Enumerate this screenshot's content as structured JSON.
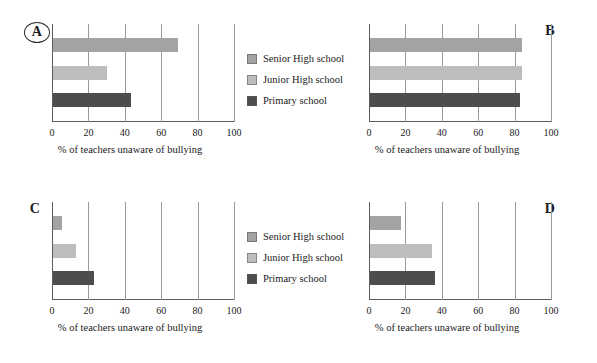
{
  "figure": {
    "x_axis_title": "% of teachers unaware of bullying",
    "tick_labels": [
      "0",
      "20",
      "40",
      "60",
      "80",
      "100"
    ],
    "x_min": 0,
    "x_max": 100,
    "colors": {
      "senior": "#a3a3a3",
      "junior": "#bdbdbd",
      "primary": "#4d4d4d",
      "axis": "#5d5d5d",
      "gridline": "#9a9a9a",
      "text": "#1a1a1a",
      "background": "#ffffff"
    }
  },
  "legend_top": {
    "name": "legend-top",
    "items": [
      {
        "label": "Senior High school",
        "color": "#a3a3a3",
        "swatch": "senior-swatch"
      },
      {
        "label": "Junior High school",
        "color": "#bdbdbd",
        "swatch": "junior-swatch"
      },
      {
        "label": "Primary school",
        "color": "#4d4d4d",
        "swatch": "primary-swatch"
      }
    ]
  },
  "legend_bottom": {
    "name": "legend-bottom",
    "items": [
      {
        "label": "Senior High school",
        "color": "#a3a3a3",
        "swatch": "senior-swatch"
      },
      {
        "label": "Junior High school",
        "color": "#bdbdbd",
        "swatch": "junior-swatch"
      },
      {
        "label": "Primary school",
        "color": "#4d4d4d",
        "swatch": "primary-swatch"
      }
    ]
  },
  "panels": [
    {
      "id": "A",
      "letter": "A",
      "circled": true,
      "position": "top-left"
    },
    {
      "id": "B",
      "letter": "B",
      "circled": false,
      "position": "top-right"
    },
    {
      "id": "C",
      "letter": "C",
      "circled": false,
      "position": "bottom-left"
    },
    {
      "id": "D",
      "letter": "D",
      "circled": false,
      "position": "bottom-right"
    }
  ],
  "chart_data": [
    {
      "type": "bar",
      "orientation": "horizontal",
      "panel": "A",
      "title": "A",
      "xlabel": "% of teachers unaware of bullying",
      "ylabel": "",
      "xlim": [
        0,
        100
      ],
      "xticks": [
        0,
        20,
        40,
        60,
        80,
        100
      ],
      "grid": true,
      "legend_position": "right",
      "categories": [
        "Senior High school",
        "Junior High school",
        "Primary school"
      ],
      "values": [
        69,
        30,
        43
      ],
      "colors": [
        "#a3a3a3",
        "#bdbdbd",
        "#4d4d4d"
      ]
    },
    {
      "type": "bar",
      "orientation": "horizontal",
      "panel": "B",
      "title": "B",
      "xlabel": "% of teachers unaware of bullying",
      "ylabel": "",
      "xlim": [
        0,
        100
      ],
      "xticks": [
        0,
        20,
        40,
        60,
        80,
        100
      ],
      "grid": true,
      "legend_position": "left",
      "categories": [
        "Senior High school",
        "Junior High school",
        "Primary school"
      ],
      "values": [
        84,
        84,
        83
      ],
      "colors": [
        "#a3a3a3",
        "#bdbdbd",
        "#4d4d4d"
      ]
    },
    {
      "type": "bar",
      "orientation": "horizontal",
      "panel": "C",
      "title": "C",
      "xlabel": "% of teachers unaware of bullying",
      "ylabel": "",
      "xlim": [
        0,
        100
      ],
      "xticks": [
        0,
        20,
        40,
        60,
        80,
        100
      ],
      "grid": true,
      "legend_position": "right",
      "categories": [
        "Senior High school",
        "Junior High school",
        "Primary school"
      ],
      "values": [
        5,
        12.5,
        22.5
      ],
      "colors": [
        "#a3a3a3",
        "#bdbdbd",
        "#4d4d4d"
      ]
    },
    {
      "type": "bar",
      "orientation": "horizontal",
      "panel": "D",
      "title": "D",
      "xlabel": "% of teachers unaware of bullying",
      "ylabel": "",
      "xlim": [
        0,
        100
      ],
      "xticks": [
        0,
        20,
        40,
        60,
        80,
        100
      ],
      "grid": true,
      "legend_position": "left",
      "categories": [
        "Senior High school",
        "Junior High school",
        "Primary school"
      ],
      "values": [
        17,
        34,
        36
      ],
      "colors": [
        "#a3a3a3",
        "#bdbdbd",
        "#4d4d4d"
      ]
    }
  ]
}
